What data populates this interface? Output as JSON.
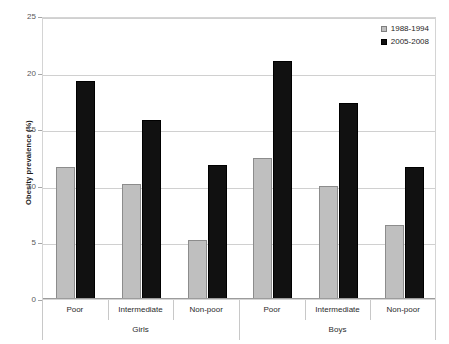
{
  "chart_data": {
    "type": "bar",
    "title": "",
    "xlabel": "",
    "ylabel": "Obesity prevalence (%)",
    "ylim": [
      0,
      25
    ],
    "yticks": [
      0,
      5,
      10,
      15,
      20,
      25
    ],
    "ytick_labels": [
      "0",
      "5",
      "10",
      "15",
      "20",
      "25"
    ],
    "grid": true,
    "legend_position": "top-right",
    "groups": [
      "Girls",
      "Boys"
    ],
    "categories": [
      "Poor",
      "Intermediate",
      "Non-poor",
      "Poor",
      "Intermediate",
      "Non-poor"
    ],
    "series": [
      {
        "name": "1988-1994",
        "color": "#bfbfbf",
        "values": [
          11.7,
          10.2,
          5.2,
          12.5,
          10.0,
          6.5
        ]
      },
      {
        "name": "2005-2008",
        "color": "#111111",
        "values": [
          19.3,
          15.8,
          11.8,
          21.0,
          17.3,
          11.7
        ]
      }
    ]
  },
  "legend": {
    "items": [
      {
        "label": "1988-1994",
        "swatch": "old"
      },
      {
        "label": "2005-2008",
        "swatch": "new"
      }
    ]
  },
  "axes": {
    "y_title": "Obesity prevalence (%)"
  }
}
